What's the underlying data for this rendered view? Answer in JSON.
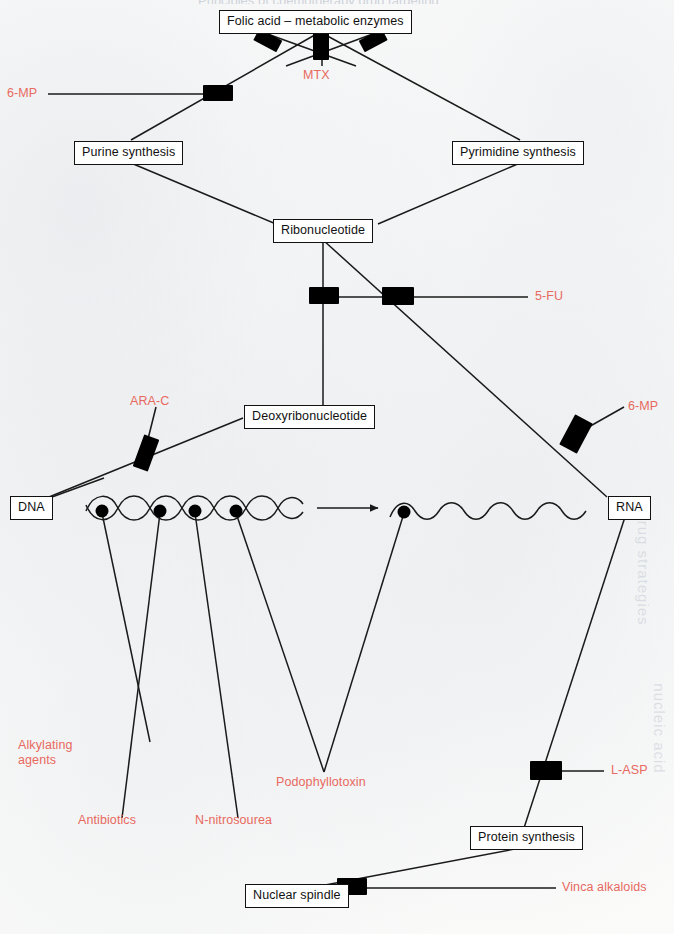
{
  "page": {
    "width": 674,
    "height": 934,
    "background_color": "#fbfbfa",
    "running_head_clipped": "Principles of chemotherapy drug targeting",
    "ghost_text_right_upper": "drug strategies",
    "ghost_text_right_lower": "nucleic acid"
  },
  "colors": {
    "line": "#1a1a1a",
    "node_text": "#111111",
    "node_border": "#111111",
    "node_fill": "#ffffff",
    "drug_label": "#e8695f",
    "blocker": "#000000"
  },
  "diagram": {
    "type": "pathway",
    "nodes": [
      {
        "id": "folic",
        "label": "Folic acid – metabolic enzymes"
      },
      {
        "id": "purine",
        "label": "Purine synthesis"
      },
      {
        "id": "pyrim",
        "label": "Pyrimidine synthesis"
      },
      {
        "id": "ribo",
        "label": "Ribonucleotide"
      },
      {
        "id": "deoxy",
        "label": "Deoxyribonucleotide"
      },
      {
        "id": "dna",
        "label": "DNA"
      },
      {
        "id": "rna",
        "label": "RNA"
      },
      {
        "id": "protein",
        "label": "Protein synthesis"
      },
      {
        "id": "spindle",
        "label": "Nuclear spindle"
      }
    ],
    "drugs": [
      {
        "id": "mtx",
        "label": "MTX",
        "target": "folic acid metabolic enzymes"
      },
      {
        "id": "mp-left",
        "label": "6-MP",
        "target": "purine synthesis"
      },
      {
        "id": "fu",
        "label": "5-FU",
        "target": "ribonucleotide to deoxyribonucleotide"
      },
      {
        "id": "arac",
        "label": "ARA-C",
        "target": "DNA synthesis"
      },
      {
        "id": "mp-right",
        "label": "6-MP",
        "target": "RNA synthesis"
      },
      {
        "id": "alkyl",
        "label": "Alkylating agents",
        "target": "DNA"
      },
      {
        "id": "anti",
        "label": "Antibiotics",
        "target": "DNA"
      },
      {
        "id": "nitro",
        "label": "N-nitrosourea",
        "target": "DNA"
      },
      {
        "id": "podo",
        "label": "Podophyllotoxin",
        "target": "DNA / RNA"
      },
      {
        "id": "lasp",
        "label": "L-ASP",
        "target": "protein synthesis"
      },
      {
        "id": "vinca",
        "label": "Vinca alkaloids",
        "target": "nuclear spindle"
      }
    ]
  }
}
